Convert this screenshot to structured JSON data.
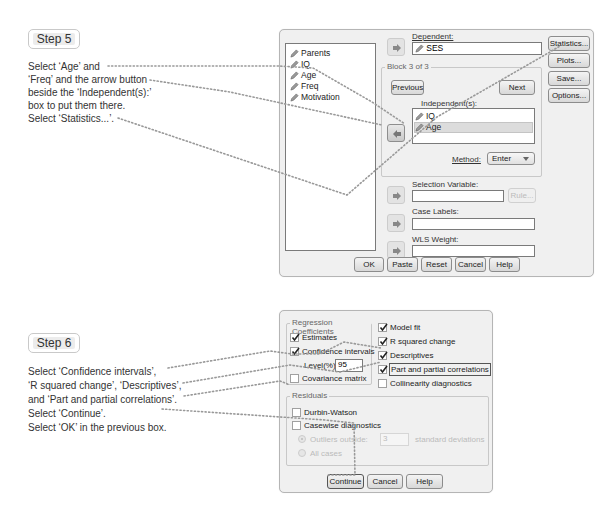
{
  "step5": {
    "badge": "Step 5",
    "instructions": [
      "Select ‘Age’ and",
      "‘Freq’ and the arrow button",
      "beside the ‘Independent(s):’",
      "box to put them there.",
      "Select ‘Statistics...’."
    ]
  },
  "step6": {
    "badge": "Step 6",
    "instructions": [
      "Select ‘Confidence intervals’,",
      "‘R squared change’, ‘Descriptives’,",
      "and ‘Part and partial correlations’.",
      "Select ‘Continue’.",
      "Select ‘OK’ in the previous box."
    ]
  },
  "regression_dialog": {
    "variables": [
      "Parents",
      "IQ",
      "Age",
      "Freq",
      "Motivation"
    ],
    "dependent": {
      "label": "Dependent:",
      "value": "SES"
    },
    "block": {
      "title": "Block 3 of 3",
      "previous": "Previous",
      "next": "Next",
      "independents_label": "Independent(s):",
      "independents": [
        "IQ",
        "Age"
      ],
      "selected_independent": "Age",
      "method_label": "Method:",
      "method_value": "Enter"
    },
    "selection_variable": {
      "label": "Selection Variable:",
      "value": "",
      "rule_button": "Rule..."
    },
    "case_labels": {
      "label": "Case Labels:",
      "value": ""
    },
    "wls_weight": {
      "label": "WLS Weight:",
      "value": ""
    },
    "side_buttons": [
      "Statistics...",
      "Plots...",
      "Save...",
      "Options..."
    ],
    "bottom_buttons": [
      "OK",
      "Paste",
      "Reset",
      "Cancel",
      "Help"
    ]
  },
  "statistics_dialog": {
    "regression_coefficients": {
      "title": "Regression Coefficients",
      "estimates": {
        "label": "Estimates",
        "checked": true
      },
      "confidence_intervals": {
        "label": "Confidence intervals",
        "checked": true
      },
      "level_label": "Level(%):",
      "level_value": "95",
      "covariance_matrix": {
        "label": "Covariance matrix",
        "checked": false
      }
    },
    "right_options": [
      {
        "label": "Model fit",
        "checked": true
      },
      {
        "label": "R squared change",
        "checked": true
      },
      {
        "label": "Descriptives",
        "checked": true
      },
      {
        "label": "Part and partial correlations",
        "checked": true
      },
      {
        "label": "Collinearity diagnostics",
        "checked": false
      }
    ],
    "residuals": {
      "title": "Residuals",
      "durbin_watson": {
        "label": "Durbin-Watson",
        "checked": false
      },
      "casewise": {
        "label": "Casewise diagnostics",
        "checked": false
      },
      "outliers_label": "Outliers outside:",
      "outliers_value": "3",
      "std_dev_label": "standard deviations",
      "all_cases_label": "All cases"
    },
    "buttons": [
      "Continue",
      "Cancel",
      "Help"
    ]
  }
}
